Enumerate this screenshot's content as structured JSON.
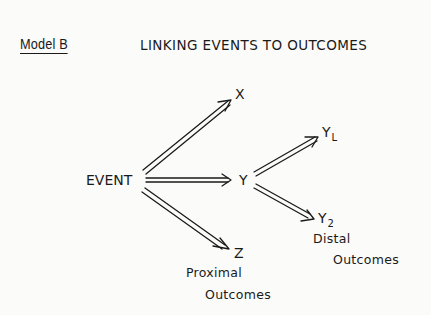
{
  "header": {
    "model_label": "Model B",
    "title": "LINKING EVENTS TO OUTCOMES"
  },
  "diagram": {
    "nodes": {
      "event": "EVENT",
      "x": "X",
      "y": "Y",
      "z": "Z",
      "y1": {
        "base": "Y",
        "sub": "L"
      },
      "y2": {
        "base": "Y",
        "sub": "2"
      }
    },
    "edges": [
      {
        "from": "EVENT",
        "to": "X",
        "style": "double-arrow"
      },
      {
        "from": "EVENT",
        "to": "Y",
        "style": "double-arrow"
      },
      {
        "from": "EVENT",
        "to": "Z",
        "style": "double-arrow"
      },
      {
        "from": "Y",
        "to": "YL",
        "style": "double-arrow"
      },
      {
        "from": "Y",
        "to": "Y2",
        "style": "double-arrow"
      }
    ],
    "captions": {
      "proximal_line1": "Proximal",
      "proximal_line2": "Outcomes",
      "distal_line1": "Distal",
      "distal_line2": "Outcomes"
    }
  }
}
